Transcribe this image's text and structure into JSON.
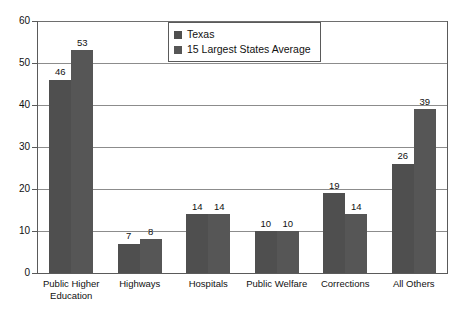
{
  "chart_data": {
    "type": "bar",
    "title": "",
    "xlabel": "",
    "ylabel": "",
    "ylim": [
      0,
      60
    ],
    "ytick_step": 10,
    "yticks": [
      "0",
      "10",
      "20",
      "30",
      "40",
      "50",
      "60"
    ],
    "grid": true,
    "legend_position": "top-center",
    "categories": [
      "Public Higher Education",
      "Highways",
      "Hospitals",
      "Public Welfare",
      "Corrections",
      "All Others"
    ],
    "category_lines": [
      [
        "Public Higher",
        "Education"
      ],
      [
        "Highways"
      ],
      [
        "Hospitals"
      ],
      [
        "Public Welfare"
      ],
      [
        "Corrections"
      ],
      [
        "All Others"
      ]
    ],
    "series": [
      {
        "name": "Texas",
        "color": "#4f4f4f",
        "values": [
          46,
          7,
          14,
          10,
          19,
          26
        ],
        "labels": [
          "46",
          "7",
          "14",
          "10",
          "19",
          "26"
        ]
      },
      {
        "name": "15 Largest States Average",
        "color": "#565656",
        "values": [
          53,
          8,
          14,
          10,
          14,
          39
        ],
        "labels": [
          "53",
          "8",
          "14",
          "10",
          "14",
          "39"
        ]
      }
    ]
  },
  "legend": {
    "entries": [
      {
        "label": "Texas"
      },
      {
        "label": "15 Largest States Average"
      }
    ]
  },
  "colors": {
    "series_1": "#4f4f4f",
    "series_2": "#565656",
    "axis": "#5a5a5a",
    "grid": "#8c8c8c",
    "text": "#111111",
    "background": "#ffffff"
  }
}
